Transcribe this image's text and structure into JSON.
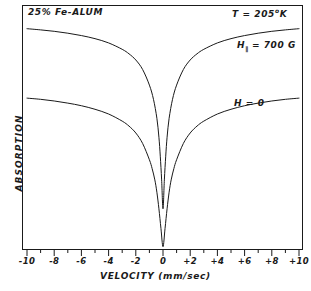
{
  "figure": {
    "title_annotation": "25% Fe-ALUM",
    "temperature_annotation_prefix": "T = 205",
    "temperature_annotation_degree": "o",
    "temperature_annotation_unit": "K",
    "field_annotation_symbol": "H",
    "field_annotation_subscript": "∥",
    "field_annotation_value": "= 700 G",
    "zero_field_annotation": "H = 0",
    "y_axis_label": "ABSORPTION",
    "x_axis_label": "VELOCITY (mm/sec)",
    "line_color": "#1a1a1a",
    "frame_color": "#1a1a1a",
    "background_color": "#ffffff"
  },
  "chart_data": {
    "type": "line",
    "title": "25% Fe-ALUM",
    "xlabel": "VELOCITY (mm/sec)",
    "ylabel": "ABSORPTION",
    "xlim": [
      -10,
      10
    ],
    "ylim": [
      0,
      1
    ],
    "grid": false,
    "legend": "inline-annotations",
    "x_major_ticks": [
      -10,
      -8,
      -6,
      -4,
      -2,
      0,
      2,
      4,
      6,
      8,
      10
    ],
    "x_major_tick_labels": [
      "-10",
      "-8",
      "-6",
      "-4",
      "-2",
      "0",
      "+2",
      "+4",
      "+6",
      "+8",
      "+10"
    ],
    "x_minor_ticks": [
      -9,
      -7,
      -5,
      -3,
      -1,
      1,
      3,
      5,
      7,
      9
    ],
    "y_ticks_shown": false,
    "annotations": [
      {
        "text": "25% Fe-ALUM",
        "x": -9.6,
        "y": 0.985
      },
      {
        "text": "T = 205 °K",
        "x": 5.2,
        "y": 0.985
      },
      {
        "text": "H∥ = 700 G",
        "x": 5.6,
        "y": 0.85
      },
      {
        "text": "H = 0",
        "x": 5.3,
        "y": 0.61
      }
    ],
    "series": [
      {
        "name": "H∥ = 700 G",
        "description": "Absorption dip with narrow central notch, baseline near top of frame",
        "x": [
          -10,
          -9,
          -8,
          -7,
          -6,
          -5,
          -4,
          -3,
          -2.5,
          -2,
          -1.5,
          -1,
          -0.7,
          -0.45,
          -0.3,
          -0.2,
          -0.1,
          0,
          0.1,
          0.2,
          0.3,
          0.45,
          0.7,
          1,
          1.5,
          2,
          2.5,
          3,
          4,
          5,
          6,
          7,
          8,
          9,
          10
        ],
        "y": [
          0.938,
          0.933,
          0.927,
          0.919,
          0.909,
          0.896,
          0.878,
          0.851,
          0.832,
          0.806,
          0.766,
          0.7,
          0.64,
          0.56,
          0.48,
          0.4,
          0.3,
          0.178,
          0.3,
          0.4,
          0.48,
          0.56,
          0.64,
          0.7,
          0.766,
          0.806,
          0.832,
          0.851,
          0.878,
          0.896,
          0.909,
          0.919,
          0.927,
          0.933,
          0.938
        ]
      },
      {
        "name": "H = 0",
        "description": "Broad absorption dip reaching the baseline at zero velocity",
        "x": [
          -10,
          -9,
          -8,
          -7,
          -6,
          -5,
          -4,
          -3,
          -2.5,
          -2,
          -1.5,
          -1,
          -0.8,
          -0.6,
          -0.45,
          -0.3,
          -0.15,
          0,
          0.15,
          0.3,
          0.45,
          0.6,
          0.8,
          1,
          1.5,
          2,
          2.5,
          3,
          4,
          5,
          6,
          7,
          8,
          9,
          10
        ],
        "y": [
          0.645,
          0.64,
          0.633,
          0.624,
          0.613,
          0.598,
          0.578,
          0.548,
          0.527,
          0.498,
          0.454,
          0.385,
          0.348,
          0.3,
          0.248,
          0.178,
          0.095,
          0.018,
          0.095,
          0.178,
          0.248,
          0.3,
          0.348,
          0.385,
          0.454,
          0.498,
          0.527,
          0.548,
          0.578,
          0.598,
          0.613,
          0.624,
          0.633,
          0.64,
          0.645
        ]
      }
    ]
  }
}
